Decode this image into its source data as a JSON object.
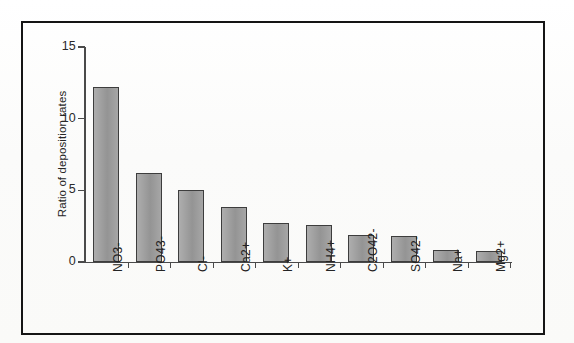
{
  "figure": {
    "background_color": "#fdfdfc",
    "frame_color": "#151515",
    "bar_fill_color": "#9c9c9c",
    "bar_border_color": "#3d3d3d",
    "axis_color": "#4a4a4a"
  },
  "chart_data": {
    "type": "bar",
    "title": "",
    "xlabel": "",
    "ylabel": "Ratio of deposition rates",
    "categories": [
      "NO3-",
      "PO43-",
      "Cl-",
      "Ca2+",
      "K+",
      "NH4+",
      "C2O42-",
      "SO42-",
      "Na+",
      "Mg2+"
    ],
    "values": [
      12.2,
      6.2,
      5.0,
      3.85,
      2.75,
      2.6,
      1.85,
      1.8,
      0.85,
      0.8
    ],
    "ylim": [
      0,
      15
    ],
    "yticks": [
      0,
      5,
      10,
      15
    ],
    "ytick_labels": [
      "0",
      "5",
      "10",
      "15"
    ],
    "grid": false,
    "legend": false,
    "legend_position": "none"
  }
}
